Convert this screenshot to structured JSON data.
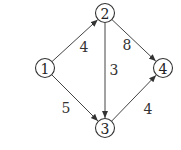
{
  "diagram": {
    "type": "directed-weighted-graph",
    "nodes": [
      {
        "id": "1",
        "label": "1",
        "x": 45,
        "y": 68
      },
      {
        "id": "2",
        "label": "2",
        "x": 105,
        "y": 13
      },
      {
        "id": "3",
        "label": "3",
        "x": 105,
        "y": 128
      },
      {
        "id": "4",
        "label": "4",
        "x": 163,
        "y": 68
      }
    ],
    "edges": [
      {
        "from": "1",
        "to": "2",
        "weight": "4",
        "label_x": 84,
        "label_y": 47
      },
      {
        "from": "1",
        "to": "3",
        "weight": "5",
        "label_x": 66,
        "label_y": 108
      },
      {
        "from": "2",
        "to": "3",
        "weight": "3",
        "label_x": 114,
        "label_y": 70
      },
      {
        "from": "2",
        "to": "4",
        "weight": "8",
        "label_x": 127,
        "label_y": 45
      },
      {
        "from": "3",
        "to": "4",
        "weight": "4",
        "label_x": 148,
        "label_y": 109
      }
    ],
    "colors": {
      "stroke": "#333333",
      "text": "#222222",
      "background": "#ffffff"
    }
  }
}
